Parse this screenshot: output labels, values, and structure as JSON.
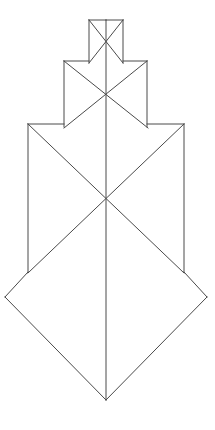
{
  "figure": {
    "background_color": "#ffffff",
    "stroke_color": "#4a4a4a",
    "stroke_width": 1,
    "canvas": {
      "width": 215,
      "height": 430
    }
  },
  "geometry": {
    "axis": {
      "name": "central-vertical-axis",
      "x": 106,
      "y_top": 20,
      "y_bottom": 400,
      "path": "M 106 20 L 106 400"
    },
    "tiers": [
      {
        "name": "top-tier",
        "index": 1,
        "left_rail_x": 89,
        "right_rail_x": 123,
        "rail_top_y": 20,
        "rail_bottom_y": 63,
        "cross_center_x": 106,
        "cross_center_y": 42,
        "apex_y": 20,
        "left_rail_path": "M 89 20 L 89 63",
        "right_rail_path": "M 123 20 L 123 63",
        "cross_left_path": "M 89 20 L 123 63",
        "cross_right_path": "M 123 20 L 89 63",
        "apex_left_path": "M 89 20 L 106 20",
        "apex_right_path": "M 123 20 L 106 20"
      },
      {
        "name": "middle-tier",
        "index": 2,
        "left_rail_x": 64,
        "right_rail_x": 147,
        "rail_top_y": 61,
        "rail_bottom_y": 127,
        "cross_center_x": 106,
        "cross_center_y": 95,
        "left_rail_path": "M 64 61 L 64 127",
        "right_rail_path": "M 147 61 L 147 127",
        "cross_left_path": "M 64 61 L 148 128",
        "cross_right_path": "M 147 61 L 64 128",
        "v_left_path": "M 64 61 L 89 61",
        "v_right_path": "M 147 61 L 123 61"
      },
      {
        "name": "bottom-tier",
        "index": 3,
        "left_rail_x": 28,
        "right_rail_x": 184,
        "rail_top_y": 124,
        "rail_bottom_y": 272,
        "cross_center_x": 106,
        "cross_center_y": 200,
        "left_rail_path": "M 28 124 L 28 272",
        "right_rail_path": "M 184 124 L 184 272",
        "cross_left_path": "M 28 124 L 184 273",
        "cross_right_path": "M 184 124 L 28 273",
        "v_left_path": "M 28 124 L 64 124",
        "v_right_path": "M 184 124 L 147 124"
      }
    ],
    "diamond": {
      "name": "base-diamond",
      "left_point_x": 5,
      "left_point_y": 297,
      "right_point_x": 207,
      "right_point_y": 297,
      "bottom_point_x": 106,
      "bottom_point_y": 400,
      "top_left_x": 28,
      "top_left_y": 272,
      "top_right_x": 184,
      "top_right_y": 272,
      "left_upper_path": "M 28 272 L 5 297",
      "right_upper_path": "M 184 272 L 207 297",
      "left_lower_path": "M 5 297 L 106 400",
      "right_lower_path": "M 207 297 L 106 400"
    }
  },
  "labels": {
    "none_visible": ""
  }
}
